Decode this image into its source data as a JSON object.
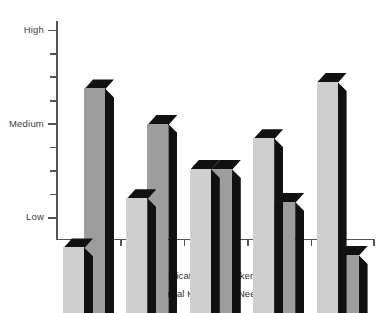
{
  "chart_data": {
    "type": "bar",
    "title": "",
    "subtitle": "",
    "xlabel": "",
    "ylabel": "",
    "categories": [
      "1985",
      "1990",
      "1995",
      "2000",
      "2005"
    ],
    "ytick_labels": [
      "Low",
      "Medium",
      "High"
    ],
    "ytick_values": [
      1,
      3,
      5
    ],
    "ylim": [
      0.55,
      5.35
    ],
    "grid": false,
    "legend_position": "bottom-center",
    "series": [
      {
        "name": "Sophistication of Attacker Tools",
        "color": "#cfcfcf",
        "values": [
          1.95,
          3.0,
          3.62,
          4.28,
          5.48
        ]
      },
      {
        "name": "Technical Knowledge Needed",
        "color": "#151515",
        "values": [
          5.34,
          4.58,
          3.62,
          2.92,
          1.79
        ]
      }
    ]
  },
  "axis": {
    "y_labels": [
      {
        "text": "High",
        "value": 5
      },
      {
        "text": "Medium",
        "value": 3
      },
      {
        "text": "Low",
        "value": 1
      }
    ],
    "x_labels": [
      "1985",
      "1990",
      "1995",
      "2000",
      "2005"
    ]
  },
  "legend": {
    "items": [
      {
        "label": "Sophistication of Attacker Tools",
        "swatch": "#cfcfcf",
        "swatch_name": "legend-swatch-light"
      },
      {
        "label": "Technical Knowledge Needed",
        "swatch": "#151515",
        "swatch_name": "legend-swatch-dark"
      }
    ]
  },
  "colors": {
    "series_light_front": "#cfcfcf",
    "series_dark_front": "#9d9d9d",
    "bar_3d_shadow": "#111111",
    "axis": "#555555",
    "text": "#3d3d3d",
    "background": "#ffffff"
  }
}
